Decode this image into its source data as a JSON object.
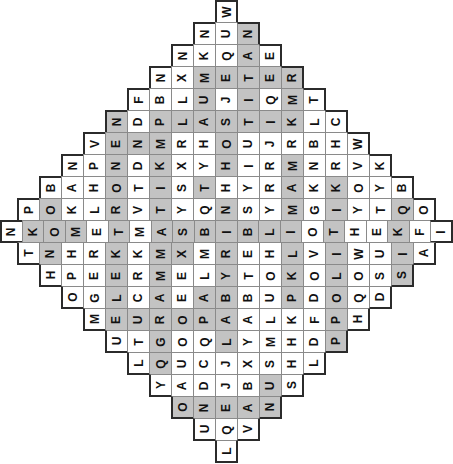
{
  "puzzle": {
    "type": "word-search",
    "shape": "diamond",
    "rows": 20,
    "max_row_length": 21,
    "cell_size_px": 23,
    "colors": {
      "cell_background": "#ffffff",
      "highlight_background": "#c3c3c3",
      "cell_border": "#8a8a8a",
      "outline": "#2b2b2b",
      "letter": "#111111"
    },
    "letter_rotation_degrees": -90,
    "grid": [
      {
        "index": 0,
        "letters": [
          "W"
        ],
        "highlight": [
          false
        ]
      },
      {
        "index": 1,
        "letters": [
          "N",
          "U",
          "N"
        ],
        "highlight": [
          false,
          false,
          true
        ]
      },
      {
        "index": 2,
        "letters": [
          "N",
          "K",
          "Q",
          "A",
          "E"
        ],
        "highlight": [
          false,
          false,
          false,
          true,
          false
        ]
      },
      {
        "index": 3,
        "letters": [
          "N",
          "X",
          "M",
          "E",
          "T",
          "E",
          "R"
        ],
        "highlight": [
          false,
          false,
          true,
          true,
          true,
          true,
          true
        ]
      },
      {
        "index": 4,
        "letters": [
          "F",
          "B",
          "L",
          "U",
          "J",
          "I",
          "Q",
          "M",
          "T"
        ],
        "highlight": [
          false,
          false,
          false,
          true,
          false,
          true,
          false,
          true,
          false
        ]
      },
      {
        "index": 5,
        "letters": [
          "N",
          "D",
          "P",
          "L",
          "A",
          "S",
          "T",
          "I",
          "K",
          "L",
          "C"
        ],
        "highlight": [
          true,
          false,
          true,
          true,
          true,
          true,
          true,
          true,
          true,
          false,
          false
        ]
      },
      {
        "index": 6,
        "letters": [
          "V",
          "E",
          "N",
          "M",
          "R",
          "H",
          "O",
          "U",
          "J",
          "R",
          "B",
          "H",
          "W"
        ],
        "highlight": [
          false,
          true,
          true,
          true,
          false,
          false,
          true,
          false,
          false,
          false,
          false,
          false,
          false
        ]
      },
      {
        "index": 7,
        "letters": [
          "N",
          "P",
          "N",
          "D",
          "K",
          "X",
          "Y",
          "H",
          "I",
          "R",
          "M",
          "N",
          "R",
          "V",
          "K"
        ],
        "highlight": [
          false,
          false,
          true,
          false,
          true,
          false,
          false,
          true,
          false,
          false,
          true,
          false,
          false,
          false,
          false
        ]
      },
      {
        "index": 8,
        "letters": [
          "B",
          "A",
          "H",
          "O",
          "T",
          "I",
          "S",
          "T",
          "H",
          "Y",
          "R",
          "A",
          "K",
          "K",
          "O",
          "Y",
          "B"
        ],
        "highlight": [
          false,
          false,
          false,
          true,
          false,
          true,
          false,
          true,
          false,
          false,
          false,
          true,
          false,
          true,
          false,
          false,
          false
        ]
      },
      {
        "index": 9,
        "letters": [
          "P",
          "O",
          "K",
          "L",
          "R",
          "V",
          "T",
          "Y",
          "Q",
          "N",
          "S",
          "Y",
          "M",
          "G",
          "I",
          "Y",
          "T",
          "Q",
          "O"
        ],
        "highlight": [
          false,
          true,
          false,
          false,
          true,
          false,
          true,
          false,
          false,
          true,
          false,
          false,
          true,
          false,
          true,
          false,
          false,
          true,
          false
        ]
      },
      {
        "index": 10,
        "letters": [
          "N",
          "K",
          "O",
          "M",
          "E",
          "T",
          "M",
          "A",
          "S",
          "B",
          "I",
          "B",
          "L",
          "I",
          "O",
          "T",
          "H",
          "E",
          "K",
          "F",
          "I"
        ],
        "highlight": [
          false,
          true,
          true,
          true,
          false,
          true,
          false,
          true,
          true,
          true,
          true,
          true,
          true,
          true,
          false,
          true,
          false,
          false,
          true,
          false,
          false
        ]
      },
      {
        "index": 11,
        "letters": [
          "T",
          "N",
          "H",
          "R",
          "K",
          "K",
          "M",
          "X",
          "M",
          "R",
          "E",
          "H",
          "L",
          "V",
          "I",
          "W",
          "U",
          "I",
          "A"
        ],
        "highlight": [
          false,
          true,
          false,
          false,
          true,
          false,
          true,
          true,
          false,
          true,
          false,
          false,
          true,
          false,
          true,
          false,
          false,
          true,
          false
        ]
      },
      {
        "index": 12,
        "letters": [
          "H",
          "P",
          "E",
          "E",
          "R",
          "M",
          "E",
          "L",
          "Y",
          "T",
          "O",
          "K",
          "O",
          "L",
          "O",
          "S",
          "S"
        ],
        "highlight": [
          false,
          false,
          false,
          true,
          false,
          true,
          false,
          false,
          true,
          false,
          false,
          true,
          false,
          true,
          false,
          false,
          true
        ]
      },
      {
        "index": 13,
        "letters": [
          "O",
          "G",
          "L",
          "C",
          "A",
          "E",
          "A",
          "B",
          "B",
          "U",
          "P",
          "D",
          "O",
          "Q",
          "D"
        ],
        "highlight": [
          false,
          false,
          true,
          false,
          true,
          false,
          true,
          true,
          false,
          false,
          true,
          false,
          true,
          false,
          false
        ]
      },
      {
        "index": 14,
        "letters": [
          "M",
          "E",
          "U",
          "R",
          "O",
          "P",
          "A",
          "A",
          "L",
          "K",
          "F",
          "P",
          "H"
        ],
        "highlight": [
          false,
          true,
          true,
          true,
          true,
          true,
          true,
          false,
          false,
          false,
          false,
          true,
          false
        ]
      },
      {
        "index": 15,
        "letters": [
          "U",
          "T",
          "G",
          "O",
          "Q",
          "L",
          "Y",
          "M",
          "H",
          "D",
          "P"
        ],
        "highlight": [
          false,
          false,
          true,
          false,
          false,
          true,
          false,
          false,
          false,
          false,
          true
        ]
      },
      {
        "index": 16,
        "letters": [
          "L",
          "Q",
          "U",
          "C",
          "J",
          "X",
          "S",
          "H",
          "L"
        ],
        "highlight": [
          false,
          true,
          false,
          false,
          false,
          false,
          false,
          false,
          false
        ]
      },
      {
        "index": 17,
        "letters": [
          "Y",
          "A",
          "D",
          "J",
          "B",
          "U",
          "S"
        ],
        "highlight": [
          false,
          false,
          false,
          false,
          false,
          true,
          false
        ]
      },
      {
        "index": 18,
        "letters": [
          "O",
          "N",
          "E",
          "A",
          "N"
        ],
        "highlight": [
          true,
          true,
          true,
          true,
          true
        ]
      },
      {
        "index": 19,
        "letters": [
          "U",
          "Q",
          "V"
        ],
        "highlight": [
          false,
          false,
          false
        ]
      },
      {
        "index": 20,
        "letters": [
          "L"
        ],
        "highlight": [
          false
        ]
      }
    ]
  }
}
